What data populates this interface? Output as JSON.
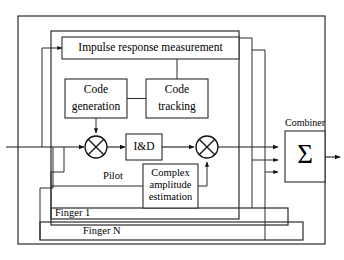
{
  "figure": {
    "kind": "block-diagram"
  },
  "blocks": {
    "impulse": {
      "label": "Impulse response measurement"
    },
    "code_generation": {
      "line1": "Code",
      "line2": "generation"
    },
    "code_tracking": {
      "line1": "Code",
      "line2": "tracking"
    },
    "integrate_dump": {
      "label": "I&D"
    },
    "complex_amplitude": {
      "line1": "Complex",
      "line2": "amplitude",
      "line3": "estimation"
    },
    "combiner": {
      "label": "Combiner",
      "symbol": "Σ"
    }
  },
  "labels": {
    "pilot": "Pilot",
    "finger_1": "Finger 1",
    "finger_n": "Finger N"
  },
  "colors": {
    "background": "#ffffff",
    "line": "#2b2b2b",
    "wire": "#1a1a1a",
    "text": "#000000"
  }
}
